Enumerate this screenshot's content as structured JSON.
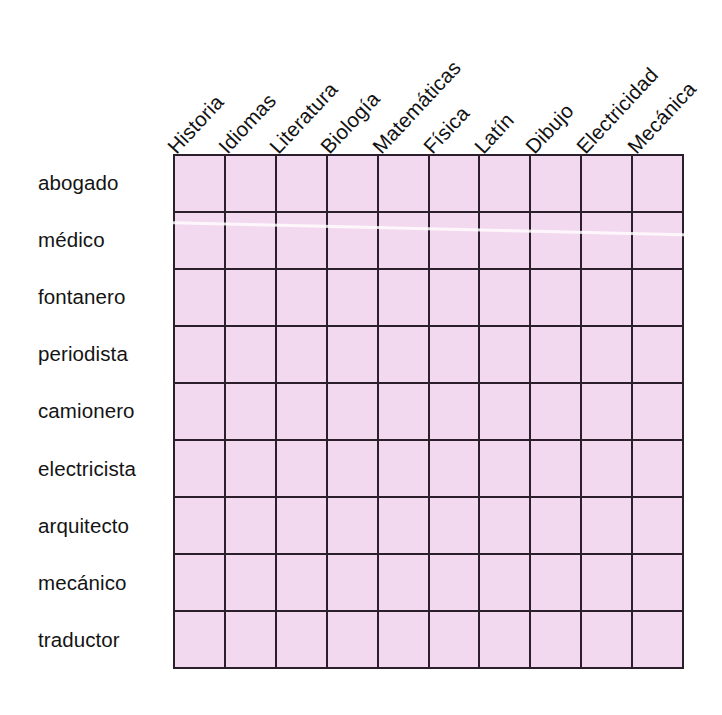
{
  "worksheet": {
    "background_color": "#ffffff",
    "cell_fill_color": "#f3d9f0",
    "grid_line_color": "#2b1f2b",
    "text_color": "#141414"
  },
  "table": {
    "column_headers": [
      "Historia",
      "Idiomas",
      "Literatura",
      "Biología",
      "Matemáticas",
      "Física",
      "Latín",
      "Dibujo",
      "Electricidad",
      "Mecánica"
    ],
    "row_labels": [
      "abogado",
      "médico",
      "fontanero",
      "periodista",
      "camionero",
      "electricista",
      "arquitecto",
      "mecánico",
      "traductor"
    ],
    "rows": [
      [
        "",
        "",
        "",
        "",
        "",
        "",
        "",
        "",
        "",
        ""
      ],
      [
        "",
        "",
        "",
        "",
        "",
        "",
        "",
        "",
        "",
        ""
      ],
      [
        "",
        "",
        "",
        "",
        "",
        "",
        "",
        "",
        "",
        ""
      ],
      [
        "",
        "",
        "",
        "",
        "",
        "",
        "",
        "",
        "",
        ""
      ],
      [
        "",
        "",
        "",
        "",
        "",
        "",
        "",
        "",
        "",
        ""
      ],
      [
        "",
        "",
        "",
        "",
        "",
        "",
        "",
        "",
        "",
        ""
      ],
      [
        "",
        "",
        "",
        "",
        "",
        "",
        "",
        "",
        "",
        ""
      ],
      [
        "",
        "",
        "",
        "",
        "",
        "",
        "",
        "",
        "",
        ""
      ],
      [
        "",
        "",
        "",
        "",
        "",
        "",
        "",
        "",
        "",
        ""
      ]
    ]
  }
}
